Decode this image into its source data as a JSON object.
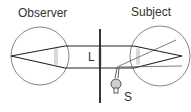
{
  "labels": {
    "observer": "Observer",
    "subject": "Subject",
    "lens": "L",
    "source": "S"
  },
  "colors": {
    "line": "#222222",
    "circle": "#555555",
    "lens_highlight": "#d8d8d8",
    "text": "#333333"
  }
}
